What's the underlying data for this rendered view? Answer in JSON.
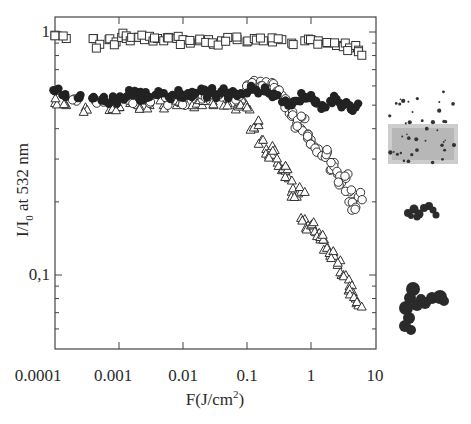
{
  "chart_data": {
    "type": "scatter",
    "title": "",
    "xlabel": "F(J/cm",
    "xlabel_sup": "2",
    "xlabel_end": ")",
    "ylabel_main": "I/I",
    "ylabel_sub": "0",
    "ylabel_rest": " at 532 nm",
    "xscale": "log",
    "yscale": "log",
    "xlim": [
      0.0001,
      10
    ],
    "ylim": [
      0.05,
      1.15
    ],
    "x_ticks": [
      "0.0001",
      "0.001",
      "0.01",
      "0.1",
      "1",
      "10"
    ],
    "y_ticks": [
      "1",
      "0,1"
    ],
    "grid": false,
    "legend": null,
    "series": [
      {
        "name": "open squares",
        "marker": "square-open",
        "x": [
          0.0001,
          0.00015,
          0.0004,
          0.0005,
          0.0007,
          0.0009,
          0.0011,
          0.0013,
          0.0015,
          0.002,
          0.0025,
          0.003,
          0.004,
          0.005,
          0.006,
          0.008,
          0.01,
          0.013,
          0.018,
          0.025,
          0.03,
          0.04,
          0.05,
          0.07,
          0.1,
          0.13,
          0.18,
          0.25,
          0.35,
          0.5,
          0.8,
          1.0,
          1.3,
          1.8,
          2.5,
          3.2,
          4.0,
          5.0,
          5.5
        ],
        "y": [
          0.97,
          0.94,
          0.94,
          0.89,
          0.93,
          0.91,
          0.95,
          0.94,
          0.92,
          0.95,
          0.93,
          0.96,
          0.94,
          0.92,
          0.95,
          0.94,
          0.93,
          0.9,
          0.92,
          0.93,
          0.89,
          0.92,
          0.95,
          0.93,
          0.91,
          0.94,
          0.92,
          0.91,
          0.93,
          0.9,
          0.92,
          0.93,
          0.92,
          0.9,
          0.88,
          0.87,
          0.86,
          0.88,
          0.83
        ]
      },
      {
        "name": "filled circles",
        "marker": "circle-filled",
        "x": [
          0.0001,
          0.00013,
          0.00025,
          0.0004,
          0.0006,
          0.0008,
          0.001,
          0.0013,
          0.0016,
          0.002,
          0.0025,
          0.003,
          0.004,
          0.005,
          0.006,
          0.008,
          0.01,
          0.012,
          0.015,
          0.02,
          0.025,
          0.03,
          0.04,
          0.05,
          0.06,
          0.08,
          0.1,
          0.12,
          0.15,
          0.2,
          0.25,
          0.3,
          0.4,
          0.5,
          0.6,
          0.8,
          1.0,
          1.2,
          1.5,
          2.0,
          2.5,
          3.0,
          4.0,
          5.0
        ],
        "y": [
          0.57,
          0.55,
          0.55,
          0.54,
          0.52,
          0.53,
          0.53,
          0.54,
          0.55,
          0.54,
          0.55,
          0.54,
          0.55,
          0.56,
          0.54,
          0.55,
          0.55,
          0.56,
          0.55,
          0.57,
          0.56,
          0.56,
          0.57,
          0.55,
          0.57,
          0.56,
          0.56,
          0.58,
          0.56,
          0.57,
          0.54,
          0.55,
          0.52,
          0.5,
          0.52,
          0.54,
          0.55,
          0.52,
          0.5,
          0.52,
          0.53,
          0.49,
          0.5,
          0.49
        ]
      },
      {
        "name": "open circles",
        "marker": "circle-open",
        "x": [
          0.0002,
          0.0005,
          0.0009,
          0.0015,
          0.003,
          0.006,
          0.01,
          0.02,
          0.04,
          0.07,
          0.1,
          0.13,
          0.16,
          0.2,
          0.25,
          0.3,
          0.35,
          0.4,
          0.45,
          0.5,
          0.6,
          0.7,
          0.8,
          0.9,
          1.0,
          1.1,
          1.3,
          1.5,
          1.8,
          2.0,
          2.3,
          2.6,
          3.0,
          3.5,
          4.0,
          4.5,
          5.0,
          5.5
        ],
        "y": [
          0.53,
          0.52,
          0.51,
          0.52,
          0.51,
          0.52,
          0.52,
          0.53,
          0.54,
          0.55,
          0.58,
          0.62,
          0.61,
          0.6,
          0.59,
          0.58,
          0.55,
          0.52,
          0.48,
          0.45,
          0.42,
          0.4,
          0.44,
          0.38,
          0.36,
          0.34,
          0.33,
          0.31,
          0.32,
          0.27,
          0.29,
          0.26,
          0.24,
          0.25,
          0.22,
          0.2,
          0.19,
          0.21
        ]
      },
      {
        "name": "open triangles",
        "marker": "triangle-open",
        "x": [
          0.0001,
          0.00015,
          0.0003,
          0.0005,
          0.0008,
          0.001,
          0.0015,
          0.002,
          0.003,
          0.005,
          0.008,
          0.01,
          0.015,
          0.02,
          0.03,
          0.05,
          0.07,
          0.09,
          0.11,
          0.13,
          0.15,
          0.17,
          0.2,
          0.22,
          0.25,
          0.3,
          0.35,
          0.4,
          0.45,
          0.5,
          0.6,
          0.7,
          0.8,
          0.9,
          1.0,
          1.2,
          1.4,
          1.6,
          1.8,
          2.0,
          2.3,
          2.6,
          3.0,
          3.5,
          4.0,
          4.5,
          5.0,
          5.5
        ],
        "y": [
          0.51,
          0.5,
          0.49,
          0.52,
          0.5,
          0.49,
          0.51,
          0.5,
          0.5,
          0.5,
          0.5,
          0.51,
          0.49,
          0.5,
          0.5,
          0.51,
          0.5,
          0.52,
          0.48,
          0.4,
          0.43,
          0.36,
          0.33,
          0.31,
          0.34,
          0.29,
          0.27,
          0.28,
          0.25,
          0.22,
          0.21,
          0.22,
          0.17,
          0.16,
          0.16,
          0.15,
          0.14,
          0.14,
          0.13,
          0.12,
          0.12,
          0.11,
          0.1,
          0.1,
          0.09,
          0.085,
          0.08,
          0.075
        ]
      }
    ],
    "insets": [
      {
        "name": "dispersed-particles-micrograph",
        "description": "gray cloud of fine particles"
      },
      {
        "name": "small-aggregate-micrograph",
        "description": "small dark cluster"
      },
      {
        "name": "large-aggregate-micrograph",
        "description": "large dark branched aggregate"
      }
    ]
  }
}
